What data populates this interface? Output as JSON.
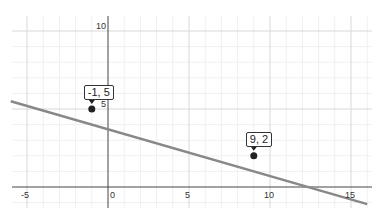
{
  "chart_data": {
    "type": "line",
    "title": "",
    "xlabel": "",
    "ylabel": "",
    "xlim": [
      -6.5,
      16.3
    ],
    "ylim": [
      -1.3,
      11
    ],
    "grid": true,
    "major_step": 5,
    "minor_step": 1,
    "x_ticks": [
      -5,
      0,
      5,
      10,
      15
    ],
    "x_tick_labels": [
      "-5",
      "0",
      "5",
      "10",
      "15"
    ],
    "y_ticks": [
      5,
      10
    ],
    "y_tick_labels": [
      "5",
      "10"
    ],
    "series": [
      {
        "name": "line through points",
        "color": "#888888",
        "x": [
          -6.0,
          16.0
        ],
        "y": [
          5.5,
          -1.1
        ]
      }
    ],
    "points": [
      {
        "x": -1,
        "y": 5,
        "label": "-1, 5"
      },
      {
        "x": 9,
        "y": 2,
        "label": "9, 2"
      }
    ]
  },
  "colors": {
    "line": "#888888",
    "axis": "#444444",
    "major_grid": "#d8d8d8",
    "minor_grid": "#f0f0f0",
    "point": "#222222"
  }
}
